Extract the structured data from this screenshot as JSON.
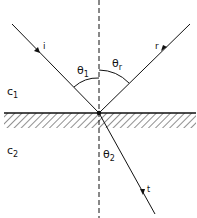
{
  "diagram": {
    "ray_labels": {
      "incident": "i",
      "reflected": "r",
      "transmitted": "t"
    },
    "angle_labels": {
      "incident": "θ",
      "incident_sub": "1",
      "reflected": "θ",
      "reflected_sub": "r",
      "transmitted": "θ",
      "transmitted_sub": "2"
    },
    "medium_labels": {
      "upper": "c",
      "upper_sub": "1",
      "lower": "c",
      "lower_sub": "2"
    },
    "colors": {
      "line": "#111111",
      "background": "#ffffff"
    }
  }
}
